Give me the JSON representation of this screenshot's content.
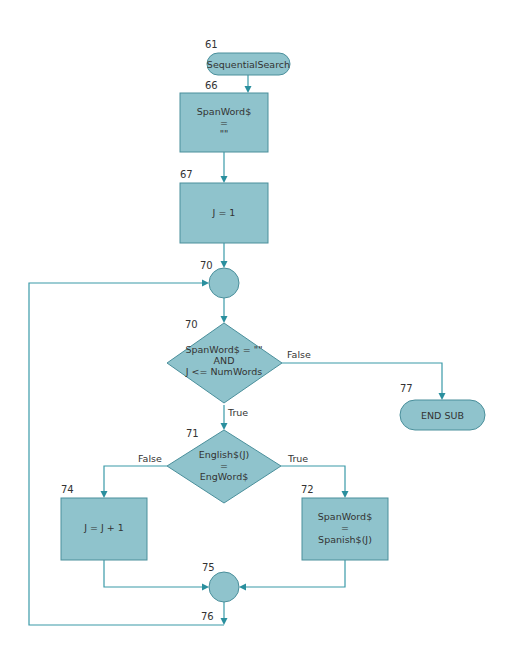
{
  "diagram": {
    "type": "flowchart",
    "colors": {
      "shape_fill": "#8fc3cc",
      "shape_stroke": "#4a8f9b",
      "connector": "#3a9aa8",
      "text": "#333333"
    },
    "nodes": [
      {
        "id": "n61",
        "line": "61",
        "shape": "terminal",
        "text": [
          "SequentialSearch"
        ]
      },
      {
        "id": "n66",
        "line": "66",
        "shape": "process",
        "text": [
          "SpanWord$",
          "=",
          "\"\""
        ]
      },
      {
        "id": "n67",
        "line": "67",
        "shape": "process",
        "text": [
          "J = 1"
        ]
      },
      {
        "id": "n70c",
        "line": "70",
        "shape": "connector",
        "text": []
      },
      {
        "id": "n70d",
        "line": "70",
        "shape": "decision",
        "text": [
          "SpanWord$ = \"\"",
          "AND",
          "J <= NumWords"
        ]
      },
      {
        "id": "n77",
        "line": "77",
        "shape": "terminal",
        "text": [
          "END SUB"
        ]
      },
      {
        "id": "n71",
        "line": "71",
        "shape": "decision",
        "text": [
          "English$(J)",
          "=",
          "EngWord$"
        ]
      },
      {
        "id": "n74",
        "line": "74",
        "shape": "process",
        "text": [
          "J = J + 1"
        ]
      },
      {
        "id": "n72",
        "line": "72",
        "shape": "process",
        "text": [
          "SpanWord$",
          "=",
          "Spanish$(J)"
        ]
      },
      {
        "id": "n75",
        "line": "75",
        "shape": "connector",
        "text": []
      },
      {
        "id": "n76",
        "line": "76",
        "shape": "label",
        "text": []
      }
    ],
    "edges": [
      {
        "from": "n61",
        "to": "n66",
        "label": ""
      },
      {
        "from": "n66",
        "to": "n67",
        "label": ""
      },
      {
        "from": "n67",
        "to": "n70c",
        "label": ""
      },
      {
        "from": "n70c",
        "to": "n70d",
        "label": ""
      },
      {
        "from": "n70d",
        "to": "n77",
        "label": "False"
      },
      {
        "from": "n70d",
        "to": "n71",
        "label": "True"
      },
      {
        "from": "n71",
        "to": "n74",
        "label": "False"
      },
      {
        "from": "n71",
        "to": "n72",
        "label": "True"
      },
      {
        "from": "n74",
        "to": "n75",
        "label": ""
      },
      {
        "from": "n72",
        "to": "n75",
        "label": ""
      },
      {
        "from": "n75",
        "to": "n70c",
        "label": "",
        "via": "76"
      }
    ],
    "labels": {
      "false": "False",
      "true": "True"
    }
  }
}
